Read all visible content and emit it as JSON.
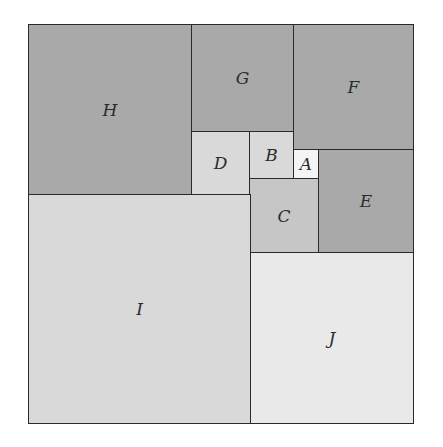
{
  "diagram": {
    "type": "squared-rectangle dissection",
    "squares": [
      {
        "label": "A",
        "shade": "white"
      },
      {
        "label": "B",
        "shade": "light"
      },
      {
        "label": "C",
        "shade": "mid"
      },
      {
        "label": "D",
        "shade": "light"
      },
      {
        "label": "E",
        "shade": "dark"
      },
      {
        "label": "F",
        "shade": "dark"
      },
      {
        "label": "G",
        "shade": "dark"
      },
      {
        "label": "H",
        "shade": "dark"
      },
      {
        "label": "I",
        "shade": "light"
      },
      {
        "label": "J",
        "shade": "lighter"
      }
    ]
  },
  "colors": {
    "dark": "#a9a9a9",
    "mid": "#c6c6c6",
    "light": "#d9d9d9",
    "lighter": "#e9e9e9",
    "white": "#f4f4f4",
    "border": "#2a2a2a"
  }
}
